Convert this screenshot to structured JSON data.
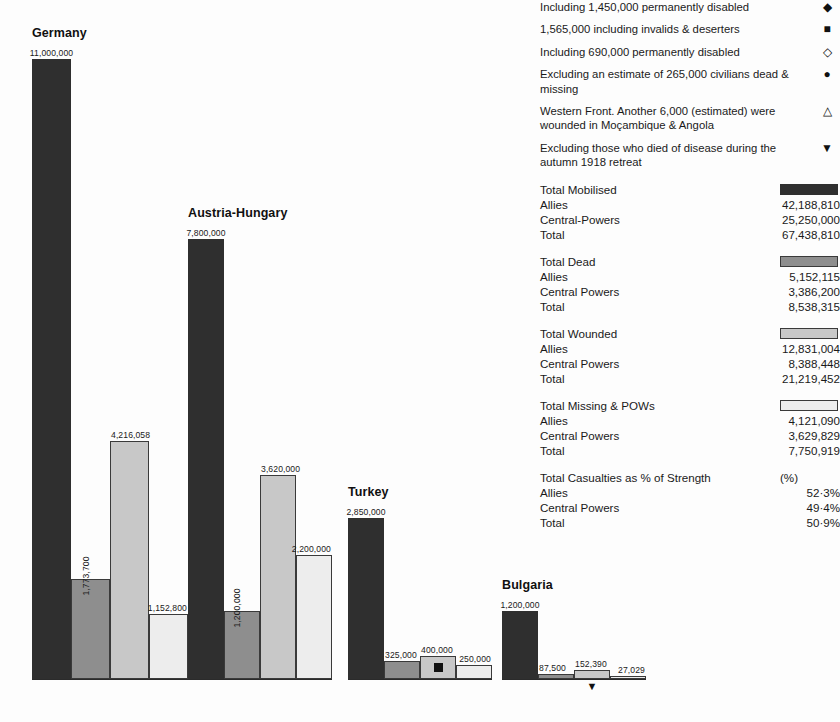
{
  "notes": [
    {
      "text": "Including 1,450,000 permanently disabled",
      "symbol": "◆",
      "symbol_name": "filled-diamond"
    },
    {
      "text": "1,565,000 including invalids & deserters",
      "symbol": "■",
      "symbol_name": "filled-square"
    },
    {
      "text": "Including 690,000 permanently disabled",
      "symbol": "◇",
      "symbol_name": "open-diamond"
    },
    {
      "text": "Excluding an estimate of 265,000 civilians dead & missing",
      "symbol": "●",
      "symbol_name": "filled-circle"
    },
    {
      "text": "Western Front. Another 6,000 (estimated) were wounded in Moçambique & Angola",
      "symbol": "△",
      "symbol_name": "open-triangle-up"
    },
    {
      "text": "Excluding those who died of disease during the autumn 1918 retreat",
      "symbol": "▼",
      "symbol_name": "filled-triangle-down"
    }
  ],
  "stats": [
    {
      "title": "Total Mobilised",
      "swatch": "s0",
      "rows": [
        {
          "name": "Allies",
          "value": "42,188,810"
        },
        {
          "name": "Central-Powers",
          "value": "25,250,000"
        },
        {
          "name": "Total",
          "value": "67,438,810"
        }
      ]
    },
    {
      "title": "Total Dead",
      "swatch": "s1",
      "rows": [
        {
          "name": "Allies",
          "value": "5,152,115"
        },
        {
          "name": "Central Powers",
          "value": "3,386,200"
        },
        {
          "name": "Total",
          "value": "8,538,315"
        }
      ]
    },
    {
      "title": "Total Wounded",
      "swatch": "s2",
      "rows": [
        {
          "name": "Allies",
          "value": "12,831,004"
        },
        {
          "name": "Central Powers",
          "value": "8,388,448"
        },
        {
          "name": "Total",
          "value": "21,219,452"
        }
      ]
    },
    {
      "title": "Total Missing & POWs",
      "swatch": "s3",
      "rows": [
        {
          "name": "Allies",
          "value": "4,121,090"
        },
        {
          "name": "Central Powers",
          "value": "3,629,829"
        },
        {
          "name": "Total",
          "value": "7,750,919"
        }
      ]
    },
    {
      "title": "Total Casualties as % of Strength",
      "swatch": null,
      "unit": "(%)",
      "rows": [
        {
          "name": "Allies",
          "value": "52·3%"
        },
        {
          "name": "Central Powers",
          "value": "49·4%"
        },
        {
          "name": "Total",
          "value": "50·9%"
        }
      ]
    }
  ],
  "chart_data": {
    "type": "bar",
    "title": "",
    "xlabel": "",
    "ylabel": "",
    "ylim": [
      0,
      11000000
    ],
    "grid": false,
    "legend_position": "right-panel",
    "series": [
      {
        "name": "Total Mobilised",
        "swatch": "s0"
      },
      {
        "name": "Total Dead",
        "swatch": "s1"
      },
      {
        "name": "Total Wounded",
        "swatch": "s2"
      },
      {
        "name": "Total Missing & POWs",
        "swatch": "s3"
      }
    ],
    "categories": [
      "Germany",
      "Austria-Hungary",
      "Turkey",
      "Bulgaria"
    ],
    "groups": [
      {
        "name": "Germany",
        "left": 32,
        "bar_width": 39,
        "bars": [
          {
            "series": "Total Mobilised",
            "value": 11000000,
            "label": "11,000,000",
            "label_style": "above",
            "style": "b0",
            "marker": null
          },
          {
            "series": "Total Dead",
            "value": 1773700,
            "label": "1,773,700",
            "label_style": "rotated",
            "style": "b1",
            "marker": null
          },
          {
            "series": "Total Wounded",
            "value": 4216058,
            "label": "4,216,058",
            "label_style": "above",
            "style": "b2",
            "marker": null
          },
          {
            "series": "Total Missing & POWs",
            "value": 1152800,
            "label": "1,152,800",
            "label_style": "above",
            "style": "b3",
            "marker": null
          }
        ]
      },
      {
        "name": "Austria-Hungary",
        "left": 188,
        "bar_width": 36,
        "bars": [
          {
            "series": "Total Mobilised",
            "value": 7800000,
            "label": "7,800,000",
            "label_style": "above",
            "style": "b0",
            "marker": null
          },
          {
            "series": "Total Dead",
            "value": 1200000,
            "label": "1,200,000",
            "label_style": "rotated",
            "style": "b1",
            "marker": null
          },
          {
            "series": "Total Wounded",
            "value": 3620000,
            "label": "3,620,000",
            "label_style": "above",
            "style": "b2",
            "marker": null
          },
          {
            "series": "Total Missing & POWs",
            "value": 2200000,
            "label": "2,200,000",
            "label_style": "above",
            "style": "b3",
            "marker": null
          }
        ]
      },
      {
        "name": "Turkey",
        "left": 348,
        "bar_width": 36,
        "bars": [
          {
            "series": "Total Mobilised",
            "value": 2850000,
            "label": "2,850,000",
            "label_style": "above",
            "style": "b0",
            "marker": null
          },
          {
            "series": "Total Dead",
            "value": 325000,
            "label": "325,000",
            "label_style": "above",
            "style": "b1",
            "marker": null
          },
          {
            "series": "Total Wounded",
            "value": 400000,
            "label": "400,000",
            "label_style": "above",
            "style": "b2",
            "marker": "filled-square"
          },
          {
            "series": "Total Missing & POWs",
            "value": 250000,
            "label": "250,000",
            "label_style": "above",
            "style": "b3",
            "marker": null
          }
        ]
      },
      {
        "name": "Bulgaria",
        "left": 502,
        "bar_width": 36,
        "bars": [
          {
            "series": "Total Mobilised",
            "value": 1200000,
            "label": "1,200,000",
            "label_style": "above",
            "style": "b0",
            "marker": null
          },
          {
            "series": "Total Dead",
            "value": 87500,
            "label": "87,500",
            "label_style": "above",
            "style": "b1",
            "marker": null
          },
          {
            "series": "Total Wounded",
            "value": 152390,
            "label": "152,390",
            "label_style": "above",
            "style": "b2",
            "marker": "filled-triangle-down-below"
          },
          {
            "series": "Total Missing & POWs",
            "value": 27029,
            "label": "27,029",
            "label_style": "above",
            "style": "b3",
            "marker": null
          }
        ]
      }
    ]
  },
  "colors": {
    "mobilised": "#2f2f2f",
    "dead": "#8e8e8e",
    "wounded": "#c8c8c8",
    "missing": "#ededed",
    "background": "#fdfdfd",
    "text": "#1a1a1a"
  }
}
